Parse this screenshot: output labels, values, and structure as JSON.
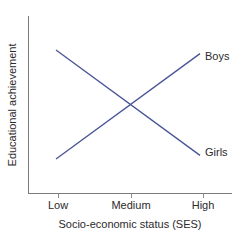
{
  "chart_data": {
    "type": "line",
    "title": "",
    "xlabel": "Socio-economic status (SES)",
    "ylabel": "Educational achievement",
    "categories": [
      "Low",
      "Medium",
      "High"
    ],
    "x": [
      0,
      1,
      2
    ],
    "series": [
      {
        "name": "Boys",
        "values": [
          20,
          50,
          80
        ],
        "color": "#4a5596",
        "trend": "increasing",
        "label_position": "right-top"
      },
      {
        "name": "Girls",
        "values": [
          80,
          50,
          20
        ],
        "color": "#4a5596",
        "trend": "decreasing",
        "label_position": "right-bottom"
      }
    ],
    "xlim": [
      0,
      2
    ],
    "ylim": [
      0,
      100
    ],
    "grid": false,
    "legend": "inline-end-labels",
    "axis_tick_labels_y": [],
    "annotations": [
      {
        "text": "Boys",
        "x": 2,
        "y": 80
      },
      {
        "text": "Girls",
        "x": 2,
        "y": 20
      }
    ]
  },
  "geometry": {
    "axis_color": "#7b7b7b",
    "plot_left": 28,
    "plot_right": 232,
    "plot_bottom": 193,
    "plot_top": 16,
    "tick_x": [
      58,
      131,
      203
    ],
    "tick_length": 4,
    "series_x_start": 56,
    "series_x_end": 200,
    "boys_y_start": 152,
    "boys_y_end": 56,
    "girls_y_start": 56,
    "girls_y_end": 152
  },
  "labels": {
    "tick_low": "Low",
    "tick_medium": "Medium",
    "tick_high": "High",
    "x_axis_title": "Socio-economic status (SES)",
    "y_axis_title": "Educational achievement",
    "series_boys": "Boys",
    "series_girls": "Girls"
  }
}
